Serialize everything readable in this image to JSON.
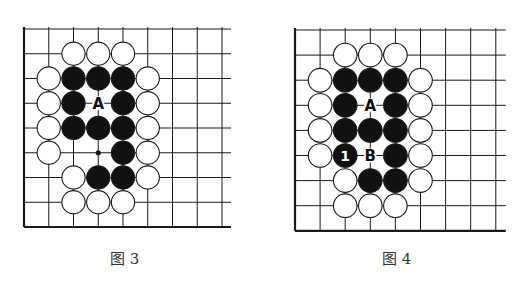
{
  "diagrams": [
    {
      "id": "fig3",
      "caption": "图 3",
      "origin": [
        24,
        29
      ],
      "spacing": 24.75,
      "grid": {
        "cols": 9,
        "rows": 9,
        "extend_right": 9,
        "extend_top": 0
      },
      "stones": [
        {
          "c": 2,
          "r": 1,
          "color": "white"
        },
        {
          "c": 3,
          "r": 1,
          "color": "white"
        },
        {
          "c": 4,
          "r": 1,
          "color": "white"
        },
        {
          "c": 1,
          "r": 2,
          "color": "white"
        },
        {
          "c": 2,
          "r": 2,
          "color": "black"
        },
        {
          "c": 3,
          "r": 2,
          "color": "black"
        },
        {
          "c": 4,
          "r": 2,
          "color": "black"
        },
        {
          "c": 5,
          "r": 2,
          "color": "white"
        },
        {
          "c": 1,
          "r": 3,
          "color": "white"
        },
        {
          "c": 2,
          "r": 3,
          "color": "black"
        },
        {
          "c": 4,
          "r": 3,
          "color": "black"
        },
        {
          "c": 5,
          "r": 3,
          "color": "white"
        },
        {
          "c": 1,
          "r": 4,
          "color": "white"
        },
        {
          "c": 2,
          "r": 4,
          "color": "black"
        },
        {
          "c": 3,
          "r": 4,
          "color": "black"
        },
        {
          "c": 4,
          "r": 4,
          "color": "black"
        },
        {
          "c": 5,
          "r": 4,
          "color": "white"
        },
        {
          "c": 1,
          "r": 5,
          "color": "white"
        },
        {
          "c": 4,
          "r": 5,
          "color": "black"
        },
        {
          "c": 5,
          "r": 5,
          "color": "white"
        },
        {
          "c": 2,
          "r": 6,
          "color": "white"
        },
        {
          "c": 3,
          "r": 6,
          "color": "black"
        },
        {
          "c": 4,
          "r": 6,
          "color": "black"
        },
        {
          "c": 5,
          "r": 6,
          "color": "white"
        },
        {
          "c": 2,
          "r": 7,
          "color": "white"
        },
        {
          "c": 3,
          "r": 7,
          "color": "white"
        },
        {
          "c": 4,
          "r": 7,
          "color": "white"
        }
      ],
      "labels": [
        {
          "c": 3,
          "r": 3,
          "text": "A"
        }
      ],
      "points": [
        {
          "c": 3,
          "r": 5
        }
      ]
    },
    {
      "id": "fig4",
      "caption": "图 4",
      "origin": [
        295,
        30
      ],
      "spacing": 25.1,
      "grid": {
        "cols": 9,
        "rows": 9,
        "extend_right": 10,
        "extend_top": 0
      },
      "stones": [
        {
          "c": 2,
          "r": 1,
          "color": "white"
        },
        {
          "c": 3,
          "r": 1,
          "color": "white"
        },
        {
          "c": 4,
          "r": 1,
          "color": "white"
        },
        {
          "c": 1,
          "r": 2,
          "color": "white"
        },
        {
          "c": 2,
          "r": 2,
          "color": "black"
        },
        {
          "c": 3,
          "r": 2,
          "color": "black"
        },
        {
          "c": 4,
          "r": 2,
          "color": "black"
        },
        {
          "c": 5,
          "r": 2,
          "color": "white"
        },
        {
          "c": 1,
          "r": 3,
          "color": "white"
        },
        {
          "c": 2,
          "r": 3,
          "color": "black"
        },
        {
          "c": 4,
          "r": 3,
          "color": "black"
        },
        {
          "c": 5,
          "r": 3,
          "color": "white"
        },
        {
          "c": 1,
          "r": 4,
          "color": "white"
        },
        {
          "c": 2,
          "r": 4,
          "color": "black"
        },
        {
          "c": 3,
          "r": 4,
          "color": "black"
        },
        {
          "c": 4,
          "r": 4,
          "color": "black"
        },
        {
          "c": 5,
          "r": 4,
          "color": "white"
        },
        {
          "c": 1,
          "r": 5,
          "color": "white"
        },
        {
          "c": 2,
          "r": 5,
          "color": "black",
          "number": "1"
        },
        {
          "c": 4,
          "r": 5,
          "color": "black"
        },
        {
          "c": 5,
          "r": 5,
          "color": "white"
        },
        {
          "c": 2,
          "r": 6,
          "color": "white"
        },
        {
          "c": 3,
          "r": 6,
          "color": "black"
        },
        {
          "c": 4,
          "r": 6,
          "color": "black"
        },
        {
          "c": 5,
          "r": 6,
          "color": "white"
        },
        {
          "c": 2,
          "r": 7,
          "color": "white"
        },
        {
          "c": 3,
          "r": 7,
          "color": "white"
        },
        {
          "c": 4,
          "r": 7,
          "color": "white"
        }
      ],
      "labels": [
        {
          "c": 3,
          "r": 3,
          "text": "A"
        },
        {
          "c": 3,
          "r": 5,
          "text": "B"
        }
      ],
      "points": []
    }
  ],
  "colors": {
    "line": "#1a1a1a",
    "black_stone": "#111111",
    "white_stone": "#ffffff",
    "caption": "#333333"
  }
}
